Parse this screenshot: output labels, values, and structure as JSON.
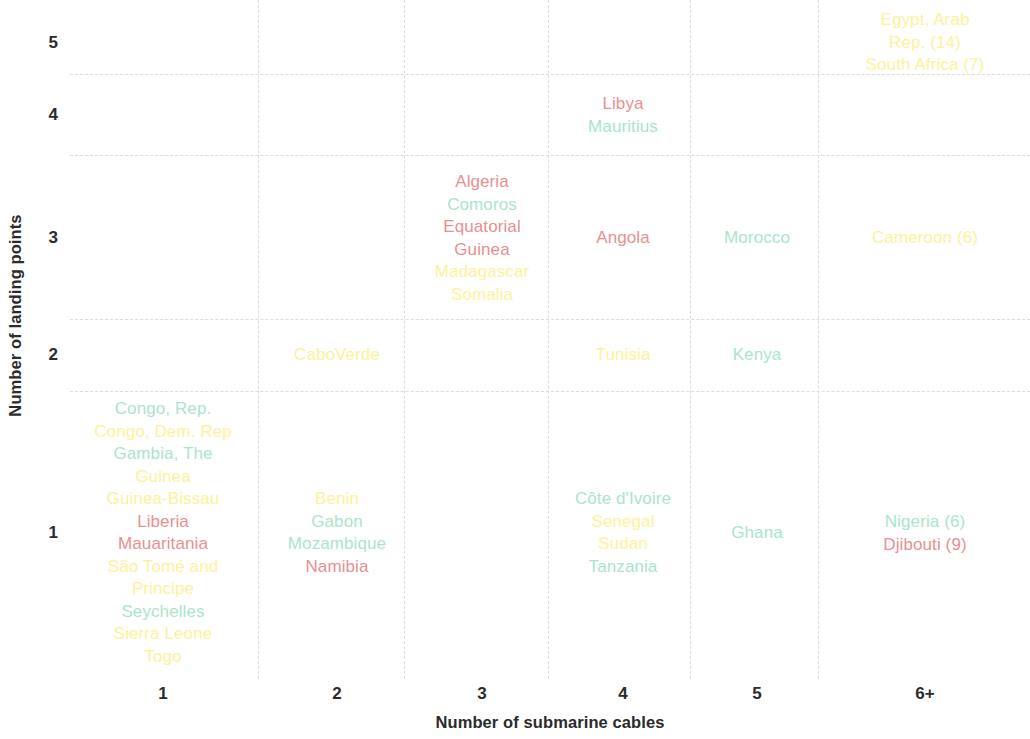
{
  "chart_data": {
    "type": "scatter",
    "title": "",
    "xlabel": "Number of submarine cables",
    "ylabel": "Number of landing points",
    "x_ticks": [
      "1",
      "2",
      "3",
      "4",
      "5",
      "6+"
    ],
    "y_ticks": [
      "1",
      "2",
      "3",
      "4",
      "5"
    ],
    "grid": true,
    "grid_style": "dashed",
    "legend": "none",
    "colors": {
      "mint": "#a9e5cd",
      "yellow": "#fbf29a",
      "salmon": "#e8908f"
    },
    "points": [
      {
        "x": "1",
        "y": "1",
        "labels": [
          {
            "text": "Congo, Rep.",
            "color": "mint"
          },
          {
            "text": "Congo, Dem. Rep",
            "color": "yellow"
          },
          {
            "text": "Gambia, The",
            "color": "mint"
          },
          {
            "text": "Guinea",
            "color": "yellow"
          },
          {
            "text": "Guinea-Bissau",
            "color": "yellow"
          },
          {
            "text": "Liberia",
            "color": "salmon"
          },
          {
            "text": "Mauaritania",
            "color": "salmon"
          },
          {
            "text": "São Tomé and Principe",
            "color": "yellow"
          },
          {
            "text": "Seychelles",
            "color": "mint"
          },
          {
            "text": "Sierra Leone",
            "color": "yellow"
          },
          {
            "text": "Togo",
            "color": "yellow"
          }
        ]
      },
      {
        "x": "2",
        "y": "1",
        "labels": [
          {
            "text": "Benin",
            "color": "yellow"
          },
          {
            "text": "Gabon",
            "color": "mint"
          },
          {
            "text": "Mozambique",
            "color": "mint"
          },
          {
            "text": "Namibia",
            "color": "salmon"
          }
        ]
      },
      {
        "x": "4",
        "y": "1",
        "labels": [
          {
            "text": "Côte d'Ivoire",
            "color": "mint"
          },
          {
            "text": "Senegal",
            "color": "yellow"
          },
          {
            "text": "Sudan",
            "color": "yellow"
          },
          {
            "text": "Tanzania",
            "color": "mint"
          }
        ]
      },
      {
        "x": "5",
        "y": "1",
        "labels": [
          {
            "text": "Ghana",
            "color": "mint"
          }
        ]
      },
      {
        "x": "6+",
        "y": "1",
        "labels": [
          {
            "text": "Nigeria (6)",
            "color": "mint"
          },
          {
            "text": "Djibouti (9)",
            "color": "salmon"
          }
        ]
      },
      {
        "x": "2",
        "y": "2",
        "labels": [
          {
            "text": "CaboVerde",
            "color": "yellow"
          }
        ]
      },
      {
        "x": "4",
        "y": "2",
        "labels": [
          {
            "text": "Tunisia",
            "color": "yellow"
          }
        ]
      },
      {
        "x": "5",
        "y": "2",
        "labels": [
          {
            "text": "Kenya",
            "color": "mint"
          }
        ]
      },
      {
        "x": "3",
        "y": "3",
        "labels": [
          {
            "text": "Algeria",
            "color": "salmon"
          },
          {
            "text": "Comoros",
            "color": "mint"
          },
          {
            "text": "Equatorial Guinea",
            "color": "salmon"
          },
          {
            "text": "Madagascar",
            "color": "yellow"
          },
          {
            "text": "Somalia",
            "color": "yellow"
          }
        ]
      },
      {
        "x": "4",
        "y": "3",
        "labels": [
          {
            "text": "Angola",
            "color": "salmon"
          }
        ]
      },
      {
        "x": "5",
        "y": "3",
        "labels": [
          {
            "text": "Morocco",
            "color": "mint"
          }
        ]
      },
      {
        "x": "6+",
        "y": "3",
        "labels": [
          {
            "text": "Cameroon (6)",
            "color": "yellow"
          }
        ]
      },
      {
        "x": "4",
        "y": "4",
        "labels": [
          {
            "text": "Libya",
            "color": "salmon"
          },
          {
            "text": "Mauritius",
            "color": "mint"
          }
        ]
      },
      {
        "x": "6+",
        "y": "5",
        "labels": [
          {
            "text": "Egypt, Arab Rep. (14)",
            "color": "yellow"
          },
          {
            "text": "South Africa (7)",
            "color": "yellow"
          }
        ]
      }
    ]
  },
  "layout": {
    "x_positions": {
      "1": 93,
      "2": 267,
      "3": 412,
      "4": 553,
      "5": 687,
      "6+": 855
    },
    "y_positions": {
      "1": 533,
      "2": 355,
      "3": 238,
      "4": 115,
      "5": 43
    },
    "gridlines_h": [
      74,
      155,
      319,
      391
    ],
    "gridlines_v": [
      188,
      334,
      478,
      620,
      748
    ]
  }
}
